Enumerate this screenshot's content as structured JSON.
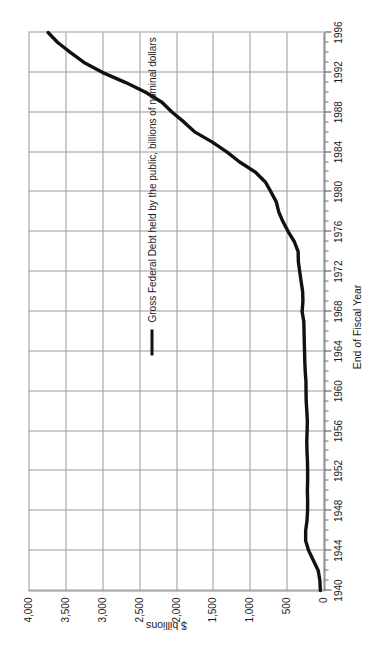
{
  "chart_data": {
    "type": "line",
    "title": "",
    "xlabel": "End of Fiscal Year",
    "ylabel": "$ billions",
    "grid": true,
    "legend_position": "inside-upper-left",
    "xlim": [
      1940,
      1996
    ],
    "ylim": [
      0,
      4000
    ],
    "xticks": [
      1940,
      1944,
      1948,
      1952,
      1956,
      1960,
      1964,
      1968,
      1972,
      1976,
      1980,
      1984,
      1988,
      1992,
      1996
    ],
    "xtick_labels": [
      "1940",
      "1944",
      "1948",
      "1952",
      "1956",
      "1960",
      "1964",
      "1968",
      "1972",
      "1976",
      "1980",
      "1984",
      "1988",
      "1992",
      "1996"
    ],
    "yticks": [
      0,
      500,
      1000,
      1500,
      2000,
      2500,
      3000,
      3500,
      4000
    ],
    "ytick_labels": [
      "0",
      "500",
      "1,000",
      "1,500",
      "2,000",
      "2,500",
      "3,000",
      "3,500",
      "4,000"
    ],
    "series": [
      {
        "name": "Gross Federal Debt held by the public, billions of nominal dollars",
        "color": "#111111",
        "x": [
          1940,
          1941,
          1942,
          1943,
          1944,
          1945,
          1946,
          1947,
          1948,
          1949,
          1950,
          1951,
          1952,
          1953,
          1954,
          1955,
          1956,
          1957,
          1958,
          1959,
          1960,
          1961,
          1962,
          1963,
          1964,
          1965,
          1966,
          1967,
          1968,
          1969,
          1970,
          1971,
          1972,
          1973,
          1974,
          1975,
          1976,
          1977,
          1978,
          1979,
          1980,
          1981,
          1982,
          1983,
          1984,
          1985,
          1986,
          1987,
          1988,
          1989,
          1990,
          1991,
          1992,
          1993,
          1994,
          1995,
          1996
        ],
        "values": [
          43,
          49,
          72,
          137,
          201,
          242,
          242,
          224,
          216,
          215,
          219,
          215,
          215,
          218,
          224,
          227,
          222,
          219,
          226,
          235,
          237,
          238,
          248,
          254,
          257,
          261,
          264,
          267,
          290,
          279,
          283,
          303,
          322,
          341,
          344,
          395,
          477,
          549,
          607,
          640,
          712,
          789,
          925,
          1137,
          1307,
          1507,
          1741,
          1890,
          2052,
          2191,
          2412,
          2689,
          3000,
          3248,
          3433,
          3604,
          3734
        ],
        "line_width_px": 3.4
      }
    ]
  },
  "axes": {
    "value_axis_title": "$ billions",
    "category_axis_title": "End of Fiscal Year"
  },
  "legend": {
    "marker": "line-swatch",
    "label": "Gross Federal Debt held by the public, billions of nominal dollars"
  }
}
